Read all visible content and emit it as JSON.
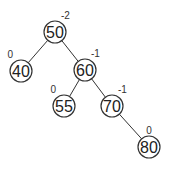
{
  "diagram": {
    "type": "avl-tree",
    "nodes": [
      {
        "id": "n50",
        "key": "50",
        "balance": "-2"
      },
      {
        "id": "n40",
        "key": "40",
        "balance": "0"
      },
      {
        "id": "n60",
        "key": "60",
        "balance": "-1"
      },
      {
        "id": "n55",
        "key": "55",
        "balance": "0"
      },
      {
        "id": "n70",
        "key": "70",
        "balance": "-1"
      },
      {
        "id": "n80",
        "key": "80",
        "balance": "0"
      }
    ],
    "edges": [
      {
        "from": "n50",
        "to": "n40"
      },
      {
        "from": "n50",
        "to": "n60"
      },
      {
        "from": "n60",
        "to": "n55"
      },
      {
        "from": "n60",
        "to": "n70"
      },
      {
        "from": "n70",
        "to": "n80"
      }
    ]
  }
}
